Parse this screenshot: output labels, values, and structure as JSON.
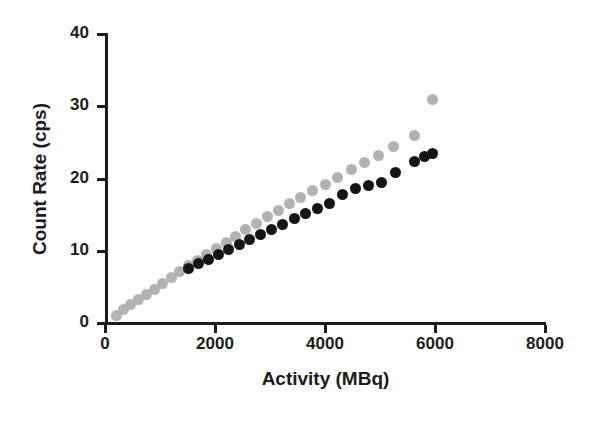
{
  "chart_data": {
    "type": "scatter",
    "title": "",
    "xlabel": "Activity (MBq)",
    "ylabel": "Count Rate (cps)",
    "xlim": [
      0,
      8000
    ],
    "ylim": [
      0,
      40
    ],
    "xticks": [
      0,
      2000,
      4000,
      6000,
      8000
    ],
    "yticks": [
      0,
      10,
      20,
      30,
      40
    ],
    "xtick_labels": [
      "0",
      "2000",
      "4000",
      "6000",
      "8000"
    ],
    "ytick_labels": [
      "0",
      "10",
      "20",
      "30",
      "40"
    ],
    "grid": false,
    "legend": "none",
    "marker_shape": "circle",
    "marker_size_px": 11,
    "series": [
      {
        "name": "light-gray-series",
        "color": "#b2b2b2",
        "x": [
          200,
          330,
          470,
          610,
          760,
          900,
          1050,
          1200,
          1360,
          1520,
          1680,
          1850,
          2020,
          2200,
          2380,
          2560,
          2750,
          2950,
          3150,
          3350,
          3560,
          3780,
          4000,
          4230,
          4480,
          4720,
          4980,
          5250,
          5620,
          5950
        ],
        "y": [
          1.1,
          1.8,
          2.5,
          3.2,
          4.0,
          4.7,
          5.5,
          6.3,
          7.1,
          7.9,
          8.7,
          9.5,
          10.3,
          11.2,
          12.0,
          12.9,
          13.8,
          14.7,
          15.6,
          16.5,
          17.4,
          18.3,
          19.2,
          20.2,
          21.2,
          22.2,
          23.2,
          24.4,
          26.0,
          31.0
        ]
      },
      {
        "name": "black-series",
        "color": "#151515",
        "x": [
          1520,
          1700,
          1880,
          2060,
          2250,
          2440,
          2630,
          2830,
          3030,
          3230,
          3440,
          3650,
          3870,
          4090,
          4320,
          4550,
          4790,
          5030,
          5280,
          5620,
          5800,
          5950
        ],
        "y": [
          7.6,
          8.2,
          8.8,
          9.5,
          10.2,
          10.9,
          11.6,
          12.3,
          13.0,
          13.7,
          14.4,
          15.1,
          15.8,
          16.6,
          17.8,
          18.6,
          19.0,
          19.4,
          20.8,
          22.3,
          23.0,
          23.5
        ]
      }
    ]
  },
  "axes": {
    "x_title": "Activity (MBq)",
    "y_title": "Count Rate (cps)"
  }
}
